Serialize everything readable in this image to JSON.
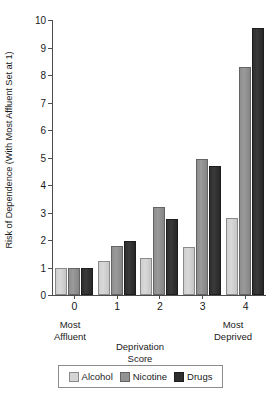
{
  "chart_data": {
    "type": "bar",
    "title": "",
    "categories": [
      "0",
      "1",
      "2",
      "3",
      "4"
    ],
    "series": [
      {
        "name": "Alcohol",
        "values": [
          1.0,
          1.25,
          1.35,
          1.75,
          2.8
        ]
      },
      {
        "name": "Nicotine",
        "values": [
          1.0,
          1.8,
          3.2,
          4.95,
          8.3
        ]
      },
      {
        "name": "Drugs",
        "values": [
          1.0,
          1.95,
          2.75,
          4.7,
          9.7
        ]
      }
    ],
    "xlabel": "Deprivation Score",
    "ylabel": "Risk of Dependence (With Most Affluent Set at 1)",
    "ylim": [
      0,
      10
    ],
    "yticks": [
      0,
      1,
      2,
      3,
      4,
      5,
      6,
      7,
      8,
      9,
      10
    ],
    "ytick_labels": [
      "0",
      "1",
      "2",
      "3",
      "4",
      "5",
      "6",
      "7",
      "8",
      "9",
      "10"
    ],
    "grid": false,
    "legend_position": "bottom"
  },
  "axes": {
    "y_title": "Risk of Dependence (With Most Affluent Set at 1)",
    "x_title_line1": "Deprivation",
    "x_title_line2": "Score",
    "x_tick_labels": [
      "0",
      "1",
      "2",
      "3",
      "4"
    ],
    "y_tick_labels": [
      "10",
      "9",
      "8",
      "7",
      "6",
      "5",
      "4",
      "3",
      "2",
      "1",
      "0"
    ]
  },
  "captions": {
    "left_line1": "Most",
    "left_line2": "Affluent",
    "right_line1": "Most",
    "right_line2": "Deprived"
  },
  "legend": {
    "entries": [
      {
        "label": "Alcohol",
        "color": "#d4d4d4",
        "key": "alcohol"
      },
      {
        "label": "Nicotine",
        "color": "#929292",
        "key": "nicotine"
      },
      {
        "label": "Drugs",
        "color": "#2e2e2e",
        "key": "drugs"
      }
    ]
  }
}
